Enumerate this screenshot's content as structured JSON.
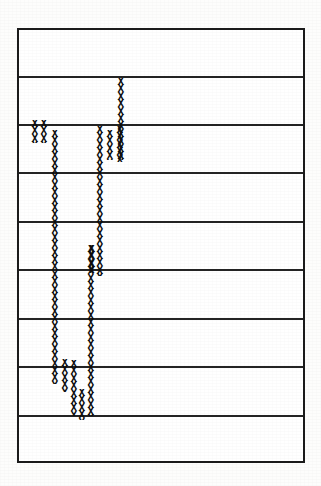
{
  "figure": {
    "kind": "scanned-hand-drawn-column-chart",
    "glyph": "X",
    "frame": {
      "left": 17,
      "top": 28,
      "width": 288,
      "height": 435,
      "border_color": "#1b1b1b",
      "background": "#ffffff"
    },
    "page_background": "#fdfdfc",
    "ink_color": "#0d0d0d"
  },
  "grid": {
    "orientation": "horizontal",
    "line_color": "#242424",
    "line_count": 8,
    "row_count": 9,
    "row_height": 48,
    "y_positions": [
      48,
      96,
      144,
      193,
      241,
      290,
      338,
      387
    ]
  },
  "chart_data": {
    "type": "bar",
    "title": "",
    "subtitle": "",
    "xlabel": "",
    "ylabel": "",
    "orientation": "vertical",
    "marker": "X",
    "grid": true,
    "legend_position": "none",
    "axis_note": "Values expressed as gridline rows measured from the top border of the frame; each row spans 48 px.",
    "ylim": [
      0,
      9
    ],
    "categories": [
      "c1",
      "c2",
      "c3",
      "c4",
      "c5",
      "c6",
      "c7",
      "c8",
      "c9",
      "c10",
      "c11",
      "c12"
    ],
    "values": [
      1.0,
      1.0,
      5.4,
      1.4,
      3.0,
      0.5,
      6.8,
      6.8,
      4.0,
      1.6,
      1.7,
      1.1
    ],
    "series": [
      {
        "name": "x-marks",
        "values": [
          1.0,
          1.0,
          5.4,
          1.4,
          3.0,
          0.5,
          6.8,
          6.8,
          4.0,
          1.6,
          1.7,
          1.1
        ]
      }
    ],
    "columns": [
      {
        "id": "c1",
        "x": 32,
        "top": 118,
        "bottom": 141,
        "marks": 3,
        "row_top": 1.88,
        "row_bottom": 2.35
      },
      {
        "id": "c2",
        "x": 41,
        "top": 118,
        "bottom": 141,
        "marks": 3,
        "row_top": 1.88,
        "row_bottom": 2.35
      },
      {
        "id": "c3",
        "x": 52,
        "top": 128,
        "bottom": 382,
        "marks": 34,
        "row_top": 2.08,
        "row_bottom": 7.38
      },
      {
        "id": "c4",
        "x": 62,
        "top": 357,
        "bottom": 390,
        "marks": 5,
        "row_top": 6.85,
        "row_bottom": 7.54
      },
      {
        "id": "c5",
        "x": 71,
        "top": 358,
        "bottom": 414,
        "marks": 8,
        "row_top": 6.88,
        "row_bottom": 8.04
      },
      {
        "id": "c6",
        "x": 79,
        "top": 387,
        "bottom": 418,
        "marks": 4,
        "row_top": 7.48,
        "row_bottom": 8.13
      },
      {
        "id": "c7",
        "x": 88,
        "top": 243,
        "bottom": 414,
        "marks": 23,
        "row_top": 4.48,
        "row_bottom": 8.04
      },
      {
        "id": "c8",
        "x": 97,
        "top": 124,
        "bottom": 274,
        "marks": 20,
        "row_top": 2.0,
        "row_bottom": 5.13
      },
      {
        "id": "c9",
        "x": 89,
        "top": 243,
        "bottom": 271,
        "marks": 4,
        "row_top": 4.48,
        "row_bottom": 5.06
      },
      {
        "id": "c10",
        "x": 107,
        "top": 128,
        "bottom": 158,
        "marks": 4,
        "row_top": 2.08,
        "row_bottom": 2.71
      },
      {
        "id": "c11",
        "x": 117,
        "top": 124,
        "bottom": 160,
        "marks": 5,
        "row_top": 2.0,
        "row_bottom": 2.75
      },
      {
        "id": "c12",
        "x": 118,
        "top": 76,
        "bottom": 158,
        "marks": 11,
        "row_top": 1.0,
        "row_bottom": 2.71
      }
    ]
  },
  "annotations": {
    "text_labels": [],
    "axis_tick_labels": []
  }
}
